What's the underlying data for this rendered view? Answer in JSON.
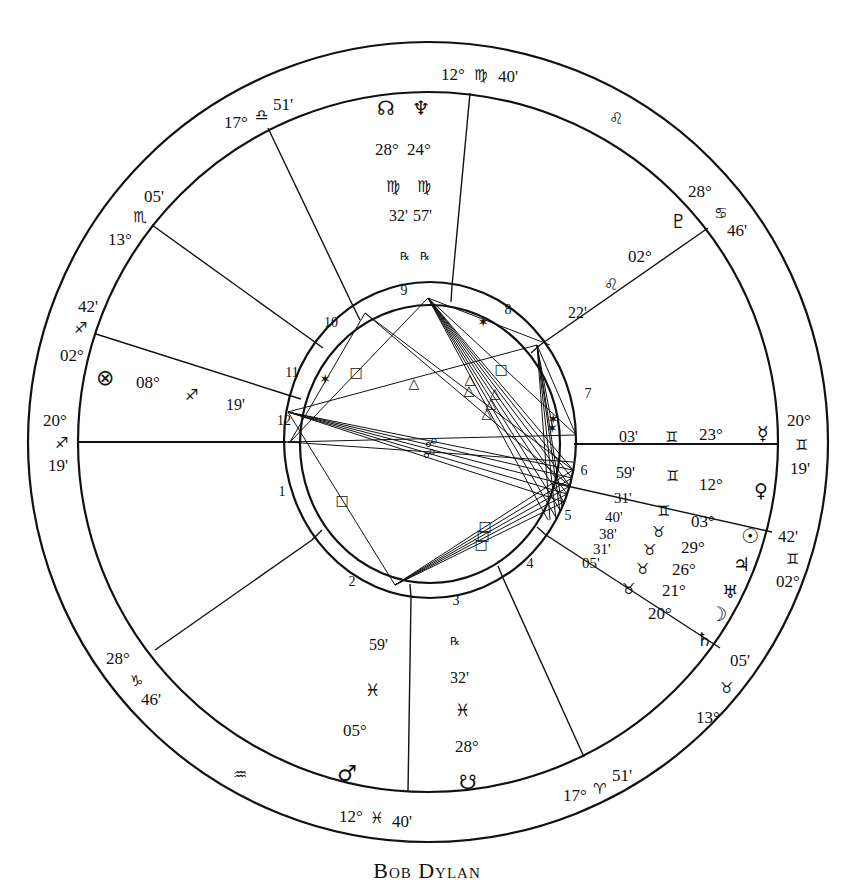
{
  "caption": "Bob Dylan",
  "colors": {
    "ink": "#111111",
    "paper": "#ffffff"
  },
  "geometry": {
    "center": [
      428,
      442
    ],
    "outer_radius": 400,
    "sign_band_inner_radius": 350,
    "house_ring_outer_radius": 146,
    "aspect_circle_radius": 130
  },
  "house_cusps": [
    {
      "house": 1,
      "label": "20° ♐ 19'",
      "deg": "20°",
      "sign": "♐",
      "min": "19'",
      "sign_name": "sagittarius"
    },
    {
      "house": 2,
      "label": "28° ♑ 46'",
      "deg": "28°",
      "sign": "♑",
      "min": "46'",
      "sign_name": "capricorn"
    },
    {
      "house": 3,
      "label": "12° ♓ 40'",
      "deg": "12°",
      "sign": "♓",
      "min": "40'",
      "sign_name": "pisces"
    },
    {
      "house": 4,
      "label": "17° ♈ 51'",
      "deg": "17°",
      "sign": "♈",
      "min": "51'",
      "sign_name": "aries"
    },
    {
      "house": 5,
      "label": "13° ♉ 05'",
      "deg": "13°",
      "sign": "♉",
      "min": "05'",
      "sign_name": "taurus"
    },
    {
      "house": 6,
      "label": "02° ♊ 42'",
      "deg": "02°",
      "sign": "♊",
      "min": "42'",
      "sign_name": "gemini"
    },
    {
      "house": 7,
      "label": "20° ♊ 19'",
      "deg": "20°",
      "sign": "♊",
      "min": "19'",
      "sign_name": "gemini"
    },
    {
      "house": 8,
      "label": "28° ♋ 46'",
      "deg": "28°",
      "sign": "♋",
      "min": "46'",
      "sign_name": "cancer"
    },
    {
      "house": 9,
      "label": "12° ♍ 40'",
      "deg": "12°",
      "sign": "♍",
      "min": "40'",
      "sign_name": "virgo"
    },
    {
      "house": 10,
      "label": "17° ♎ 51'",
      "deg": "17°",
      "sign": "♎",
      "min": "51'",
      "sign_name": "libra"
    },
    {
      "house": 11,
      "label": "13° ♏ 05'",
      "deg": "13°",
      "sign": "♏",
      "min": "05'",
      "sign_name": "scorpio"
    },
    {
      "house": 12,
      "label": "02° ♐ 42'",
      "deg": "02°",
      "sign": "♐",
      "min": "42'",
      "sign_name": "sagittarius"
    }
  ],
  "intercepted_signs": [
    {
      "sign": "♌",
      "sign_name": "leo"
    },
    {
      "sign": "♒",
      "sign_name": "aquarius"
    }
  ],
  "planets": [
    {
      "name": "mercury",
      "glyph": "☿",
      "deg": "23°",
      "sign": "♊",
      "min": "03'"
    },
    {
      "name": "venus",
      "glyph": "♀",
      "deg": "12°",
      "sign": "♊",
      "min": "59'"
    },
    {
      "name": "sun",
      "glyph": "☉",
      "deg": "03°",
      "sign": "♊",
      "min": "31'"
    },
    {
      "name": "jupiter",
      "glyph": "♃",
      "deg": "29°",
      "sign": "♉",
      "min": "40'"
    },
    {
      "name": "uranus",
      "glyph": "♅",
      "deg": "26°",
      "sign": "♉",
      "min": "38'"
    },
    {
      "name": "moon",
      "glyph": "☽",
      "deg": "21°",
      "sign": "♉",
      "min": "31'"
    },
    {
      "name": "saturn",
      "glyph": "♄",
      "deg": "20°",
      "sign": "♉",
      "min": "05'"
    },
    {
      "name": "mars",
      "glyph": "♂",
      "deg": "05°",
      "sign": "♓",
      "min": "59'"
    },
    {
      "name": "south-node",
      "glyph": "☋",
      "deg": "28°",
      "sign": "♓",
      "min": "32'",
      "retro": "℞"
    },
    {
      "name": "north-node",
      "glyph": "☊",
      "deg": "28°",
      "sign": "♍",
      "min": "32'",
      "retro": "℞"
    },
    {
      "name": "neptune",
      "glyph": "♆",
      "deg": "24°",
      "sign": "♍",
      "min": "57'",
      "retro": "℞"
    },
    {
      "name": "pluto",
      "glyph": "♇",
      "deg": "02°",
      "sign": "♌",
      "min": "22'"
    },
    {
      "name": "part-of-fortune",
      "glyph": "⊗",
      "deg": "08°",
      "sign": "♐",
      "min": "19'"
    }
  ],
  "house_numbers": [
    "1",
    "2",
    "3",
    "4",
    "5",
    "6",
    "7",
    "8",
    "9",
    "10",
    "11",
    "12"
  ],
  "aspect_symbols": {
    "square": "□",
    "trine": "△",
    "sextile": "✶",
    "opposition": "☍"
  }
}
